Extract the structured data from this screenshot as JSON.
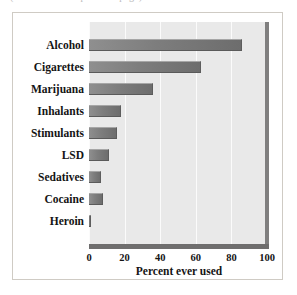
{
  "figure": {
    "clipped_caption": "(continued from previous page)"
  },
  "chart_data": {
    "type": "bar",
    "orientation": "horizontal",
    "title": "",
    "xlabel": "Percent ever used",
    "ylabel": "",
    "xlim": [
      0,
      100
    ],
    "xticks": [
      0,
      20,
      40,
      60,
      80,
      100
    ],
    "grid": "vertical white gridlines at each tick",
    "legend": "none",
    "panel_color": "#e9e9e9",
    "bar_color": "#7d7d7d",
    "categories": [
      "Alcohol",
      "Cigarettes",
      "Marijuana",
      "Inhalants",
      "Stimulants",
      "LSD",
      "Sedatives",
      "Cocaine",
      "Heroin"
    ],
    "values": [
      86,
      63,
      36,
      18,
      16,
      11,
      7,
      8,
      1
    ]
  }
}
